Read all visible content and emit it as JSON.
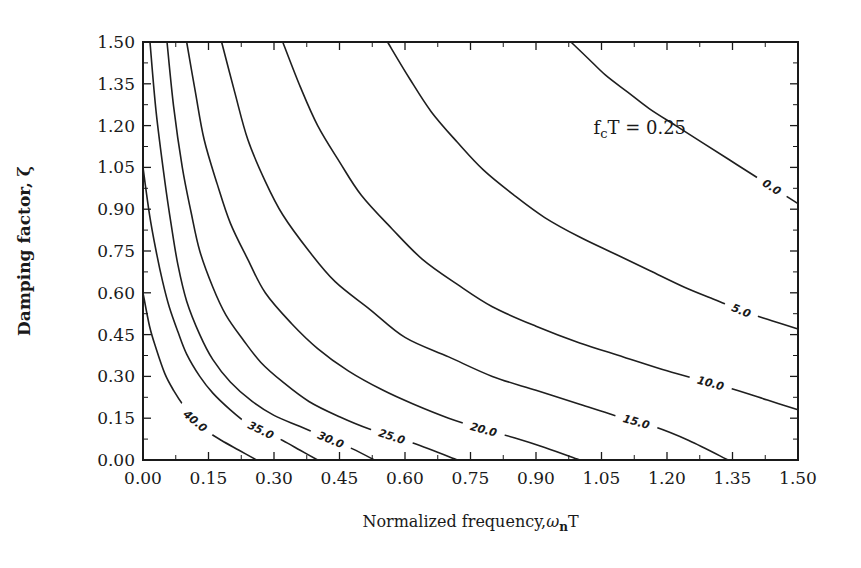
{
  "chart_data": {
    "type": "line",
    "subtype": "contour",
    "title": "",
    "xlabel": "Normalized frequency,",
    "xlabel_symbol": "ω",
    "xlabel_subscript": "n",
    "xlabel_suffix": "T",
    "ylabel": "Damping factor, ζ",
    "xlim": [
      0,
      1.5
    ],
    "ylim": [
      0,
      1.5
    ],
    "x_ticks": [
      "0.00",
      "0.15",
      "0.30",
      "0.45",
      "0.60",
      "0.75",
      "0.90",
      "1.05",
      "1.20",
      "1.35",
      "1.50"
    ],
    "y_ticks": [
      "0.00",
      "0.15",
      "0.30",
      "0.45",
      "0.60",
      "0.75",
      "0.90",
      "1.05",
      "1.20",
      "1.35",
      "1.50"
    ],
    "grid": false,
    "annotation": {
      "prefix": "f",
      "subscript": "c",
      "suffix": "T = 0.25",
      "x": 1.05,
      "y": 1.2
    },
    "series": [
      {
        "name": "40.0",
        "label": "40.0",
        "label_at": 0.12,
        "points": [
          [
            0,
            0.6
          ],
          [
            0.015,
            0.48
          ],
          [
            0.03,
            0.4
          ],
          [
            0.05,
            0.31
          ],
          [
            0.07,
            0.25
          ],
          [
            0.095,
            0.19
          ],
          [
            0.12,
            0.14
          ],
          [
            0.15,
            0.1
          ],
          [
            0.18,
            0.07
          ],
          [
            0.22,
            0.035
          ],
          [
            0.26,
            0
          ]
        ]
      },
      {
        "name": "35.0",
        "label": "35.0",
        "label_at": 0.27,
        "points": [
          [
            0,
            1.05
          ],
          [
            0.015,
            0.88
          ],
          [
            0.03,
            0.75
          ],
          [
            0.045,
            0.64
          ],
          [
            0.06,
            0.55
          ],
          [
            0.08,
            0.46
          ],
          [
            0.1,
            0.38
          ],
          [
            0.13,
            0.3
          ],
          [
            0.16,
            0.24
          ],
          [
            0.2,
            0.18
          ],
          [
            0.24,
            0.13
          ],
          [
            0.28,
            0.1
          ],
          [
            0.32,
            0.07
          ],
          [
            0.36,
            0.035
          ],
          [
            0.4,
            0
          ]
        ]
      },
      {
        "name": "30.0",
        "label": "30.0",
        "label_at": 0.43,
        "points": [
          [
            0.016,
            1.5
          ],
          [
            0.03,
            1.25
          ],
          [
            0.05,
            1.0
          ],
          [
            0.065,
            0.84
          ],
          [
            0.08,
            0.7
          ],
          [
            0.1,
            0.57
          ],
          [
            0.13,
            0.45
          ],
          [
            0.16,
            0.36
          ],
          [
            0.2,
            0.28
          ],
          [
            0.25,
            0.21
          ],
          [
            0.3,
            0.16
          ],
          [
            0.36,
            0.12
          ],
          [
            0.42,
            0.08
          ],
          [
            0.48,
            0.04
          ],
          [
            0.53,
            0
          ]
        ]
      },
      {
        "name": "25.0",
        "label": "25.0",
        "label_at": 0.57,
        "points": [
          [
            0.055,
            1.5
          ],
          [
            0.07,
            1.27
          ],
          [
            0.09,
            1.05
          ],
          [
            0.11,
            0.89
          ],
          [
            0.13,
            0.75
          ],
          [
            0.16,
            0.62
          ],
          [
            0.19,
            0.52
          ],
          [
            0.23,
            0.43
          ],
          [
            0.27,
            0.35
          ],
          [
            0.32,
            0.28
          ],
          [
            0.38,
            0.21
          ],
          [
            0.45,
            0.155
          ],
          [
            0.52,
            0.11
          ],
          [
            0.62,
            0.06
          ],
          [
            0.72,
            0
          ]
        ]
      },
      {
        "name": "20.0",
        "label": "20.0",
        "label_at": 0.78,
        "points": [
          [
            0.1,
            1.5
          ],
          [
            0.12,
            1.32
          ],
          [
            0.14,
            1.15
          ],
          [
            0.17,
            0.99
          ],
          [
            0.2,
            0.85
          ],
          [
            0.24,
            0.72
          ],
          [
            0.28,
            0.6
          ],
          [
            0.34,
            0.49
          ],
          [
            0.4,
            0.4
          ],
          [
            0.47,
            0.32
          ],
          [
            0.55,
            0.25
          ],
          [
            0.62,
            0.2
          ],
          [
            0.7,
            0.15
          ],
          [
            0.78,
            0.11
          ],
          [
            0.85,
            0.08
          ],
          [
            0.92,
            0.045
          ],
          [
            1.0,
            0
          ]
        ]
      },
      {
        "name": "15.0",
        "label": "15.0",
        "label_at": 1.13,
        "points": [
          [
            0.18,
            1.5
          ],
          [
            0.21,
            1.32
          ],
          [
            0.24,
            1.15
          ],
          [
            0.28,
            1.0
          ],
          [
            0.32,
            0.88
          ],
          [
            0.38,
            0.75
          ],
          [
            0.44,
            0.64
          ],
          [
            0.52,
            0.54
          ],
          [
            0.6,
            0.44
          ],
          [
            0.7,
            0.37
          ],
          [
            0.8,
            0.3
          ],
          [
            0.9,
            0.25
          ],
          [
            1.0,
            0.2
          ],
          [
            1.08,
            0.16
          ],
          [
            1.17,
            0.12
          ],
          [
            1.25,
            0.07
          ],
          [
            1.34,
            0
          ]
        ]
      },
      {
        "name": "10.0",
        "label": "10.0",
        "label_at": 1.3,
        "points": [
          [
            0.32,
            1.5
          ],
          [
            0.36,
            1.34
          ],
          [
            0.4,
            1.2
          ],
          [
            0.45,
            1.07
          ],
          [
            0.5,
            0.95
          ],
          [
            0.57,
            0.83
          ],
          [
            0.64,
            0.72
          ],
          [
            0.72,
            0.63
          ],
          [
            0.8,
            0.55
          ],
          [
            0.9,
            0.48
          ],
          [
            1.0,
            0.42
          ],
          [
            1.1,
            0.37
          ],
          [
            1.2,
            0.32
          ],
          [
            1.28,
            0.285
          ],
          [
            1.36,
            0.25
          ],
          [
            1.43,
            0.215
          ],
          [
            1.5,
            0.18
          ]
        ]
      },
      {
        "name": "5.0",
        "label": "5.0",
        "label_at": 1.37,
        "points": [
          [
            0.56,
            1.5
          ],
          [
            0.61,
            1.37
          ],
          [
            0.66,
            1.25
          ],
          [
            0.72,
            1.14
          ],
          [
            0.78,
            1.04
          ],
          [
            0.85,
            0.95
          ],
          [
            0.92,
            0.87
          ],
          [
            1.0,
            0.8
          ],
          [
            1.08,
            0.74
          ],
          [
            1.16,
            0.68
          ],
          [
            1.24,
            0.62
          ],
          [
            1.31,
            0.575
          ],
          [
            1.38,
            0.53
          ],
          [
            1.44,
            0.5
          ],
          [
            1.5,
            0.47
          ]
        ]
      },
      {
        "name": "0.0",
        "label": "0.0",
        "label_at": 1.44,
        "points": [
          [
            0.98,
            1.5
          ],
          [
            1.02,
            1.44
          ],
          [
            1.06,
            1.38
          ],
          [
            1.11,
            1.32
          ],
          [
            1.16,
            1.26
          ],
          [
            1.22,
            1.2
          ],
          [
            1.28,
            1.14
          ],
          [
            1.34,
            1.08
          ],
          [
            1.4,
            1.02
          ],
          [
            1.45,
            0.97
          ],
          [
            1.5,
            0.92
          ]
        ]
      }
    ]
  }
}
